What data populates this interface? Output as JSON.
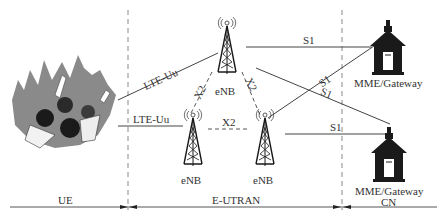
{
  "diagram": {
    "regions": [
      {
        "id": "ue",
        "label": "UE"
      },
      {
        "id": "eutran",
        "label": "E-UTRAN"
      },
      {
        "id": "cn",
        "label": "CN"
      }
    ],
    "nodes": {
      "ue_crowd": {
        "label": "",
        "icon": "crowd-of-users"
      },
      "enb_top": {
        "label": "eNB",
        "icon": "cell-tower-icon"
      },
      "enb_left": {
        "label": "eNB",
        "icon": "cell-tower-icon"
      },
      "enb_right": {
        "label": "eNB",
        "icon": "cell-tower-icon"
      },
      "mme_top": {
        "label": "MME/Gateway",
        "icon": "gateway-building-icon"
      },
      "mme_bottom": {
        "label": "MME/Gateway",
        "icon": "gateway-building-icon"
      }
    },
    "links": {
      "lte_uu_top": "LTE-Uu",
      "lte_uu_left": "LTE-Uu",
      "x2_left": "X2",
      "x2_right": "X2",
      "x2_bottom": "X2",
      "s1_top": "S1",
      "s1_cross_up": "S1",
      "s1_cross_down": "S1",
      "s1_bottom": "S1"
    },
    "colors": {
      "line": "#444444",
      "icon": "#1a1a1a",
      "crowd_bg": "#8a8a8a"
    }
  }
}
